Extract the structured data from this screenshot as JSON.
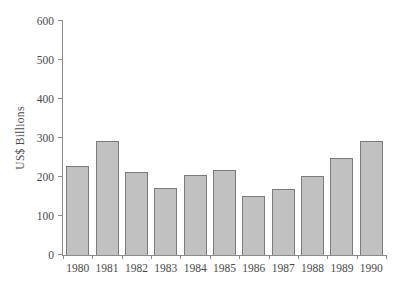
{
  "chart_data": {
    "type": "bar",
    "title": "",
    "xlabel": "",
    "ylabel": "US$ Billions",
    "categories": [
      "1980",
      "1981",
      "1982",
      "1983",
      "1984",
      "1985",
      "1986",
      "1987",
      "1988",
      "1989",
      "1990"
    ],
    "values": [
      227,
      292,
      212,
      172,
      205,
      217,
      152,
      168,
      203,
      248,
      292
    ],
    "ylim": [
      0,
      600
    ],
    "ytick_interval": 100,
    "yticks": [
      0,
      100,
      200,
      300,
      400,
      500,
      600
    ],
    "grid": false,
    "legend": "none",
    "colors": {
      "bar_fill": "#c1c1c1",
      "bar_border": "#7c7c7c",
      "axis": "#8c8c8c",
      "text": "#4a4a4a",
      "background": "#ffffff"
    }
  }
}
